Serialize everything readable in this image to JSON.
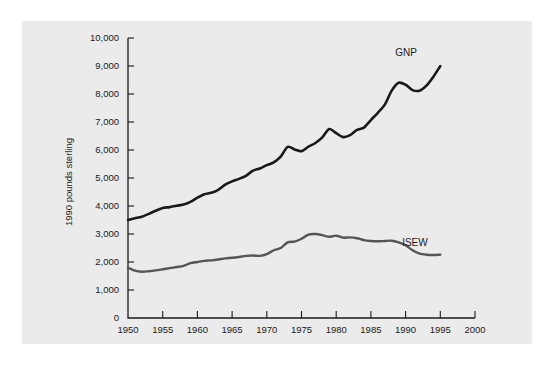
{
  "figure": {
    "background_color": "#ffffff",
    "panel_color": "#ebebeb",
    "axis_color": "#1a1a1a"
  },
  "chart_data": {
    "type": "line",
    "title": "",
    "subtitle": "",
    "xlabel": "",
    "ylabel": "1990 pounds sterling",
    "xlim": [
      1950,
      2000
    ],
    "ylim": [
      0,
      10000
    ],
    "grid": false,
    "legend_position": "inline-end-of-line",
    "x_tick_labels": [
      "1950",
      "1955",
      "1960",
      "1965",
      "1970",
      "1975",
      "1980",
      "1985",
      "1990",
      "1995",
      "2000"
    ],
    "x_ticks": [
      1950,
      1955,
      1960,
      1965,
      1970,
      1975,
      1980,
      1985,
      1990,
      1995,
      2000
    ],
    "y_tick_labels": [
      "0",
      "1,000",
      "2,000",
      "3,000",
      "4,000",
      "5,000",
      "6,000",
      "7,000",
      "8,000",
      "9,000",
      "10,000"
    ],
    "y_ticks": [
      0,
      1000,
      2000,
      3000,
      4000,
      5000,
      6000,
      7000,
      8000,
      9000,
      10000
    ],
    "series": [
      {
        "name": "GNP",
        "label": "GNP",
        "color": "#1a1a1a",
        "width": 2.6,
        "label_x": 1988.5,
        "label_y": 9350,
        "x": [
          1950,
          1951,
          1952,
          1953,
          1954,
          1955,
          1956,
          1957,
          1958,
          1959,
          1960,
          1961,
          1962,
          1963,
          1964,
          1965,
          1966,
          1967,
          1968,
          1969,
          1970,
          1971,
          1972,
          1973,
          1974,
          1975,
          1976,
          1977,
          1978,
          1979,
          1980,
          1981,
          1982,
          1983,
          1984,
          1985,
          1986,
          1987,
          1988,
          1989,
          1990,
          1991,
          1992,
          1993,
          1994,
          1995
        ],
        "y": [
          3500,
          3560,
          3620,
          3720,
          3830,
          3930,
          3960,
          4010,
          4050,
          4150,
          4300,
          4420,
          4470,
          4580,
          4760,
          4880,
          4970,
          5080,
          5260,
          5340,
          5460,
          5560,
          5760,
          6110,
          6020,
          5960,
          6120,
          6250,
          6450,
          6750,
          6600,
          6460,
          6530,
          6720,
          6800,
          7070,
          7330,
          7620,
          8120,
          8400,
          8330,
          8140,
          8120,
          8300,
          8620,
          9000
        ]
      },
      {
        "name": "ISEW",
        "label": "ISEW",
        "color": "#555555",
        "width": 2.4,
        "label_x": 1989.5,
        "label_y": 2560,
        "x": [
          1950,
          1951,
          1952,
          1953,
          1954,
          1955,
          1956,
          1957,
          1958,
          1959,
          1960,
          1961,
          1962,
          1963,
          1964,
          1965,
          1966,
          1967,
          1968,
          1969,
          1970,
          1971,
          1972,
          1973,
          1974,
          1975,
          1976,
          1977,
          1978,
          1979,
          1980,
          1981,
          1982,
          1983,
          1984,
          1985,
          1986,
          1987,
          1988,
          1989,
          1990,
          1991,
          1992,
          1993,
          1994,
          1995
        ],
        "y": [
          1800,
          1690,
          1650,
          1670,
          1700,
          1740,
          1780,
          1820,
          1860,
          1960,
          2000,
          2040,
          2060,
          2090,
          2130,
          2150,
          2180,
          2220,
          2230,
          2220,
          2280,
          2420,
          2500,
          2700,
          2730,
          2830,
          2980,
          3000,
          2960,
          2900,
          2940,
          2870,
          2880,
          2850,
          2780,
          2750,
          2740,
          2750,
          2760,
          2700,
          2600,
          2420,
          2300,
          2260,
          2250,
          2260
        ]
      }
    ]
  },
  "annotations": {
    "y_axis_title": "1990 pounds sterling"
  }
}
